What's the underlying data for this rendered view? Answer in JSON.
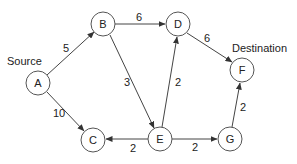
{
  "diagram": {
    "type": "weighted-directed-graph",
    "annotations": {
      "source_label": "Source",
      "destination_label": "Destination"
    },
    "nodes": [
      {
        "id": "A",
        "label": "A",
        "x": 38,
        "y": 83
      },
      {
        "id": "B",
        "label": "B",
        "x": 103,
        "y": 24
      },
      {
        "id": "C",
        "label": "C",
        "x": 93,
        "y": 140
      },
      {
        "id": "D",
        "label": "D",
        "x": 178,
        "y": 24
      },
      {
        "id": "E",
        "label": "E",
        "x": 160,
        "y": 139
      },
      {
        "id": "F",
        "label": "F",
        "x": 242,
        "y": 70
      },
      {
        "id": "G",
        "label": "G",
        "x": 230,
        "y": 139
      }
    ],
    "edges": [
      {
        "from": "A",
        "to": "B",
        "weight": "5"
      },
      {
        "from": "A",
        "to": "C",
        "weight": "10"
      },
      {
        "from": "B",
        "to": "D",
        "weight": "6"
      },
      {
        "from": "B",
        "to": "E",
        "weight": "3"
      },
      {
        "from": "D",
        "to": "F",
        "weight": "6"
      },
      {
        "from": "E",
        "to": "D",
        "weight": "2"
      },
      {
        "from": "E",
        "to": "C",
        "weight": "2"
      },
      {
        "from": "E",
        "to": "G",
        "weight": "2"
      },
      {
        "from": "G",
        "to": "F",
        "weight": "2"
      }
    ],
    "colors": {
      "stroke": "#444444",
      "text": "#222222",
      "background": "#ffffff"
    }
  }
}
